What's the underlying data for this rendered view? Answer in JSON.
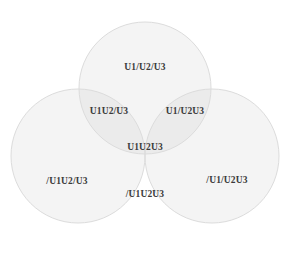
{
  "diagram": {
    "type": "venn-3-set",
    "title": "",
    "background_color": "#ffffff",
    "circle_fill_color": "#f4f4f4",
    "circle_stroke_color": "#d8d8d8",
    "overlap_shade_color": "#e3e3e3",
    "label_color": "#3a3a3a",
    "sets": [
      {
        "name": "U1",
        "position": "top"
      },
      {
        "name": "U2",
        "position": "bottom-left"
      },
      {
        "name": "U3",
        "position": "bottom-right"
      }
    ],
    "regions": [
      {
        "id": "top-only",
        "label": "U1/U2/U3",
        "description": "top circle only",
        "x": 145,
        "y": 68
      },
      {
        "id": "top-left-overlap",
        "label": "U1U2/U3",
        "description": "top and left circles overlap",
        "x": 109,
        "y": 112
      },
      {
        "id": "top-right-overlap",
        "label": "U1/U2U3",
        "description": "top and right circles overlap",
        "x": 185,
        "y": 112
      },
      {
        "id": "center-overlap",
        "label": "U1U2U3",
        "description": "all three circles overlap",
        "x": 145,
        "y": 148
      },
      {
        "id": "left-only",
        "label": "/U1U2/U3",
        "description": "left circle only",
        "x": 67,
        "y": 182
      },
      {
        "id": "right-only",
        "label": "/U1/U2U3",
        "description": "right circle only",
        "x": 227,
        "y": 181
      },
      {
        "id": "bottom-overlap",
        "label": "/U1U2U3",
        "description": "left and right circles overlap",
        "x": 145,
        "y": 195
      }
    ],
    "circles": [
      {
        "id": "circle-top",
        "cx": 145,
        "cy": 88,
        "r": 66
      },
      {
        "id": "circle-left",
        "cx": 78,
        "cy": 156,
        "r": 67
      },
      {
        "id": "circle-right",
        "cx": 212,
        "cy": 156,
        "r": 67
      }
    ]
  }
}
